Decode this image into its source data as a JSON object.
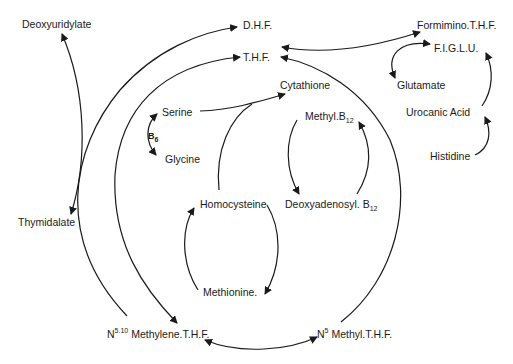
{
  "diagram": {
    "type": "metabolic-pathway",
    "colors": {
      "line": "#1a1a1a",
      "background": "#ffffff"
    },
    "nodes": {
      "deoxyuridylate": "Deoxyuridylate",
      "dhf": "D.H.F.",
      "thf": "T.H.F.",
      "formimino_thf": "Formimino.T.H.F.",
      "figlu": "F.I.G.L.U.",
      "glutamate": "Glutamate",
      "cytathione": "Cytathione",
      "serine": "Serine",
      "b6_base": "B",
      "b6_sub": "6",
      "glycine": "Glycine",
      "methyl_b12_base": "Methyl.B",
      "methyl_b12_sub": "12",
      "urocanic_acid": "Urocanic Acid",
      "histidine": "Histidine",
      "homocysteine": "Homocysteine",
      "deoxyadenosyl_b12_base": "Deoxyadenosyl. B",
      "deoxyadenosyl_b12_sub": "12",
      "thymidalate": "Thymidalate",
      "methionine": "Methionine.",
      "methylene_thf_prefix": "N",
      "methylene_thf_sup": "5.10",
      "methylene_thf_name": " Methylene.T.H.F.",
      "methyl_thf_prefix": "N",
      "methyl_thf_sup": "5",
      "methyl_thf_name": " Methyl.T.H.F."
    },
    "edges": [
      {
        "from": "Thymidalate",
        "to": "Deoxyuridylate",
        "bidirectional": true
      },
      {
        "from": "N5.10 Methylene.T.H.F.",
        "to": "D.H.F."
      },
      {
        "from": "T.H.F.",
        "to": "N5.10 Methylene.T.H.F."
      },
      {
        "from": "N5 Methyl.T.H.F.",
        "to": "T.H.F."
      },
      {
        "from": "N5.10 Methylene.T.H.F.",
        "to": "N5 Methyl.T.H.F.",
        "bidirectional": true
      },
      {
        "from": "Formimino.T.H.F.",
        "to": "T.H.F.",
        "bidirectional": true
      },
      {
        "from": "F.I.G.L.U.",
        "to": "Glutamate",
        "bidirectional": true
      },
      {
        "from": "Urocanic Acid",
        "to": "F.I.G.L.U."
      },
      {
        "from": "Histidine",
        "to": "Urocanic Acid"
      },
      {
        "from": "Serine",
        "to": "Cytathione"
      },
      {
        "from": "Homocysteine",
        "to": "Cytathione"
      },
      {
        "from": "Serine",
        "to": "Glycine",
        "bidirectional": true,
        "label": "B6"
      },
      {
        "from": "Methyl.B12",
        "to": "Deoxyadenosyl. B12"
      },
      {
        "from": "Deoxyadenosyl. B12",
        "to": "Methyl.B12"
      },
      {
        "from": "Homocysteine",
        "to": "Methionine."
      },
      {
        "from": "Methionine.",
        "to": "Homocysteine"
      }
    ]
  }
}
